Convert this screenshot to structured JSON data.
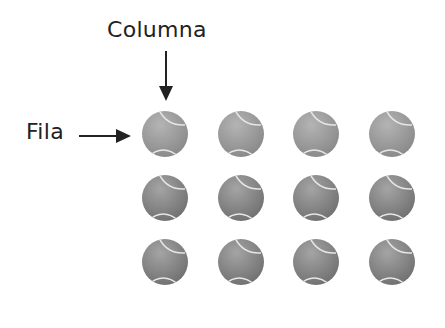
{
  "labels": {
    "column": "Columna",
    "row": "Fila"
  },
  "grid": {
    "rows": 3,
    "columns": 4,
    "object": "tennis-ball",
    "col_x": [
      165,
      241,
      316,
      392
    ],
    "row_y": [
      134,
      198,
      262
    ],
    "radius": 24
  },
  "colors": {
    "text": "#222222",
    "arrow": "#222222",
    "ball_light": "#b4b4b4",
    "ball_dark": "#6f6f6f",
    "seam": "#e6e6e6"
  }
}
